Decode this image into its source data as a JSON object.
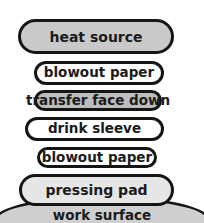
{
  "diagram": {
    "type": "layer-stack",
    "layers": [
      {
        "label": "heat source",
        "fill": "#c9c9c9"
      },
      {
        "label": "blowout paper",
        "fill": "#ffffff"
      },
      {
        "label": "transfer face down",
        "fill": "#bdbdbd"
      },
      {
        "label": "drink sleeve",
        "fill": "#ffffff"
      },
      {
        "label": "blowout paper",
        "fill": "#ffffff"
      },
      {
        "label": "pressing pad",
        "fill": "#e6e6e6"
      },
      {
        "label": "work surface",
        "fill": "#cfcfcf"
      }
    ],
    "outline_color": "#151515"
  }
}
